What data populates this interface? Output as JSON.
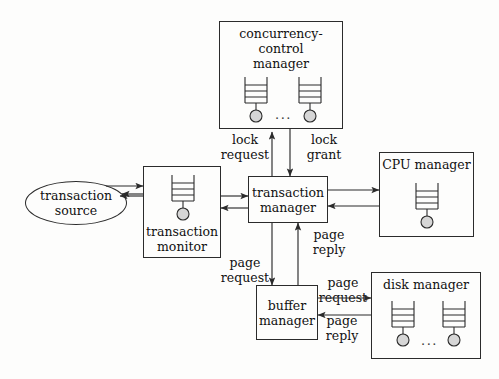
{
  "diagram": {
    "background_color": "#fdfdfc",
    "line_color": "#2b2b2b",
    "queue_fill_color": "#d6d6d6",
    "nodes": [
      {
        "id": "concurrency-control-manager",
        "label": "concurrency-control\nmanager",
        "shape": "rect",
        "label_position": "top",
        "queues": 2,
        "ellipsis": "..."
      },
      {
        "id": "transaction-source",
        "label": "transaction\nsource",
        "shape": "ellipse",
        "label_position": "middle",
        "queues": 0,
        "ellipsis": ""
      },
      {
        "id": "transaction-monitor",
        "label": "transaction\nmonitor",
        "shape": "rect",
        "label_position": "bottom",
        "queues": 1,
        "ellipsis": ""
      },
      {
        "id": "transaction-manager",
        "label": "transaction\nmanager",
        "shape": "rect",
        "label_position": "middle",
        "queues": 0,
        "ellipsis": ""
      },
      {
        "id": "cpu-manager",
        "label": "CPU manager",
        "shape": "rect",
        "label_position": "top",
        "queues": 1,
        "ellipsis": ""
      },
      {
        "id": "buffer-manager",
        "label": "buffer\nmanager",
        "shape": "rect",
        "label_position": "middle",
        "queues": 0,
        "ellipsis": ""
      },
      {
        "id": "disk-manager",
        "label": "disk manager",
        "shape": "rect",
        "label_position": "top",
        "queues": 2,
        "ellipsis": "..."
      }
    ],
    "edge_labels": [
      {
        "id": "lock-request",
        "text": "lock\nrequest"
      },
      {
        "id": "lock-grant",
        "text": "lock\ngrant"
      },
      {
        "id": "page-request-buffer",
        "text": "page\nrequest"
      },
      {
        "id": "page-reply-manager",
        "text": "page\nreply"
      },
      {
        "id": "page-request-disk",
        "text": "page\nrequest"
      },
      {
        "id": "page-reply-disk",
        "text": "page\nreply"
      }
    ],
    "edges": [
      {
        "from": "transaction-manager",
        "to": "concurrency-control-manager",
        "label": "lock request"
      },
      {
        "from": "concurrency-control-manager",
        "to": "transaction-manager",
        "label": "lock grant"
      },
      {
        "from": "transaction-source",
        "to": "transaction-monitor",
        "label": ""
      },
      {
        "from": "transaction-monitor",
        "to": "transaction-source",
        "label": ""
      },
      {
        "from": "transaction-monitor",
        "to": "transaction-manager",
        "label": ""
      },
      {
        "from": "transaction-manager",
        "to": "transaction-monitor",
        "label": ""
      },
      {
        "from": "transaction-manager",
        "to": "cpu-manager",
        "label": ""
      },
      {
        "from": "cpu-manager",
        "to": "transaction-manager",
        "label": ""
      },
      {
        "from": "transaction-manager",
        "to": "buffer-manager",
        "label": "page request"
      },
      {
        "from": "buffer-manager",
        "to": "transaction-manager",
        "label": "page reply"
      },
      {
        "from": "buffer-manager",
        "to": "disk-manager",
        "label": "page request"
      },
      {
        "from": "disk-manager",
        "to": "buffer-manager",
        "label": "page reply"
      }
    ]
  }
}
